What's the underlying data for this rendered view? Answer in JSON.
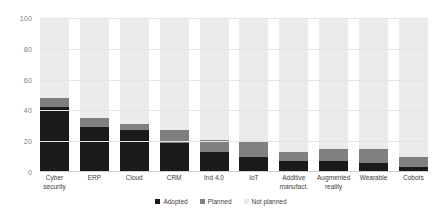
{
  "chart_data": {
    "type": "bar",
    "subtype": "stacked-percentage-column",
    "title": "",
    "xlabel": "",
    "ylabel": "",
    "ylim": [
      0,
      100
    ],
    "yticks": [
      "0",
      "20",
      "40",
      "60",
      "80",
      "100"
    ],
    "grid": true,
    "legend_position": "bottom-center",
    "categories": [
      "Cyber security",
      "ERP",
      "Cloud",
      "CRM",
      "Ind 4.0",
      "IoT",
      "Additive manufact.",
      "Augmented reality",
      "Wearable",
      "Cobots"
    ],
    "series": [
      {
        "name": "Adopted",
        "color": "#1a1a1a",
        "values": [
          42,
          29,
          27,
          19,
          13,
          10,
          7,
          7,
          6,
          3
        ]
      },
      {
        "name": "Planned",
        "color": "#808080",
        "values": [
          6,
          6,
          4,
          8,
          8,
          10,
          6,
          8,
          9,
          7
        ]
      },
      {
        "name": "Not planned",
        "color": "#ebebeb",
        "values": [
          52,
          65,
          69,
          73,
          79,
          80,
          87,
          85,
          85,
          90
        ]
      }
    ]
  },
  "legend": {
    "items": [
      {
        "label": "Adopted",
        "color": "#1a1a1a"
      },
      {
        "label": "Planned",
        "color": "#808080"
      },
      {
        "label": "Not planned",
        "color": "#ebebeb"
      }
    ]
  },
  "colors": {
    "background": "#ffffff",
    "gridline": "#e4e4e4",
    "tick_text": "#7f7f7f",
    "label_text": "#3d3d3d"
  }
}
